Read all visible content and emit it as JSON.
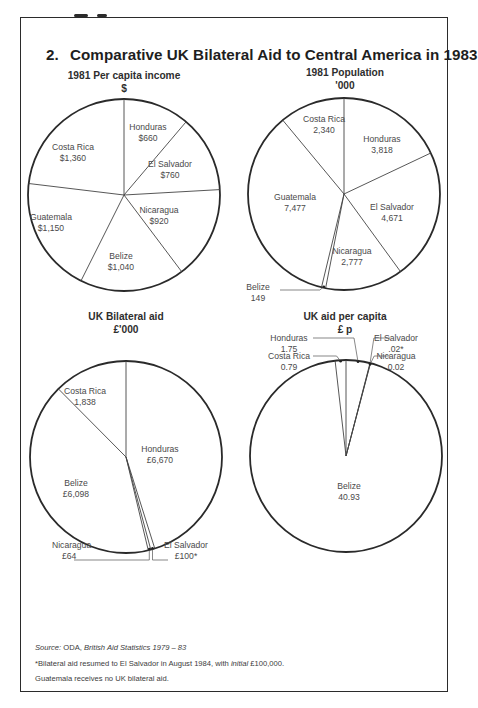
{
  "title": {
    "number": "2.",
    "text": "Comparative UK Bilateral Aid to Central America in 1983"
  },
  "charts": [
    {
      "id": "income",
      "heading": "1981 Per capita income",
      "unit": "$"
    },
    {
      "id": "population",
      "heading": "1981 Population",
      "unit": "'000"
    },
    {
      "id": "aid",
      "heading": "UK Bilateral aid",
      "unit": "£'000"
    },
    {
      "id": "aid_per_capita",
      "heading": "UK aid per capita",
      "unit": "£ p"
    }
  ],
  "notes": {
    "source_label": "Source:",
    "source_org": "ODA,",
    "source_title": "British Aid Statistics 1979 – 83",
    "footnote_pre": "*Bilateral aid resumed to El Salvador in August 1984, with",
    "footnote_italic": "initial",
    "footnote_post": "£100,000.",
    "guatemala_note": "Guatemala receives no UK bilateral aid."
  },
  "chart_data": [
    {
      "type": "pie",
      "title": "1981 Per capita income ($)",
      "categories": [
        "Honduras",
        "El Salvador",
        "Nicaragua",
        "Belize",
        "Guatemala",
        "Costa Rica"
      ],
      "values": [
        660,
        760,
        920,
        1040,
        1150,
        1360
      ],
      "labels": [
        "$660",
        "$760",
        "$920",
        "$1,040",
        "$1,150",
        "$1,360"
      ],
      "start": "12 o'clock, clockwise"
    },
    {
      "type": "pie",
      "title": "1981 Population ('000)",
      "categories": [
        "Honduras",
        "El Salvador",
        "Nicaragua",
        "Belize",
        "Guatemala",
        "Costa Rica"
      ],
      "values": [
        3818,
        4671,
        2777,
        149,
        7477,
        2340
      ],
      "labels": [
        "3,818",
        "4,671",
        "2,777",
        "149",
        "7,477",
        "2,340"
      ],
      "start": "12 o'clock, clockwise"
    },
    {
      "type": "pie",
      "title": "UK Bilateral aid (£'000)",
      "categories": [
        "Honduras",
        "El Salvador",
        "Nicaragua",
        "Belize",
        "Costa Rica"
      ],
      "values": [
        6670,
        100,
        64,
        6098,
        1838
      ],
      "labels": [
        "£6,670",
        "£100*",
        "£64",
        "£6,098",
        "1,838"
      ],
      "start": "12 o'clock, clockwise"
    },
    {
      "type": "pie",
      "title": "UK aid per capita (£ p)",
      "categories": [
        "Honduras",
        "El Salvador",
        "Nicaragua",
        "Belize",
        "Costa Rica"
      ],
      "values": [
        1.75,
        0.02,
        0.02,
        40.93,
        0.79
      ],
      "labels": [
        "1.75",
        ".02*",
        "0.02",
        "40.93",
        "0.79"
      ],
      "start": "12 o'clock, clockwise"
    }
  ]
}
